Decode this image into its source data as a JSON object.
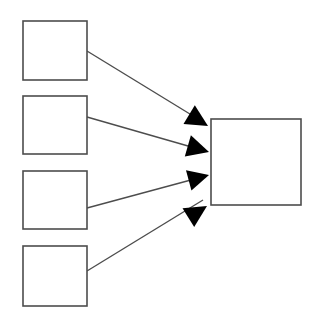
{
  "diagram": {
    "title": "",
    "type": "fan-in-flow",
    "canvas": {
      "width": 312,
      "height": 326,
      "background": "#ffffff"
    },
    "style": {
      "node_stroke_color": "#4d4d4d",
      "node_fill_color": "#ffffff",
      "node_stroke_width": 1.6,
      "edge_stroke_color": "#4d4d4d",
      "edge_stroke_width": 1.4,
      "arrow_fill_color": "#000000"
    },
    "nodes": [
      {
        "id": "source-1",
        "label": "",
        "x": 23,
        "y": 21,
        "width": 64,
        "height": 59
      },
      {
        "id": "source-2",
        "label": "",
        "x": 23,
        "y": 96,
        "width": 64,
        "height": 58
      },
      {
        "id": "source-3",
        "label": "",
        "x": 23,
        "y": 171,
        "width": 64,
        "height": 58
      },
      {
        "id": "source-4",
        "label": "",
        "x": 23,
        "y": 246,
        "width": 64,
        "height": 60
      },
      {
        "id": "target-1",
        "label": "",
        "x": 211,
        "y": 119,
        "width": 90,
        "height": 86
      }
    ],
    "edges": [
      {
        "id": "edge-1",
        "from": "source-1",
        "to": "target-1",
        "label": "",
        "x1": 87,
        "y1": 51,
        "x2": 203,
        "y2": 122,
        "arrow": {
          "tip_x": 208,
          "tip_y": 126,
          "angle": 31,
          "size": 22
        }
      },
      {
        "id": "edge-2",
        "from": "source-2",
        "to": "target-1",
        "label": "",
        "x1": 87,
        "y1": 117,
        "x2": 202,
        "y2": 150,
        "arrow": {
          "tip_x": 209,
          "tip_y": 152,
          "angle": 16,
          "size": 22
        }
      },
      {
        "id": "edge-3",
        "from": "source-3",
        "to": "target-1",
        "label": "",
        "x1": 87,
        "y1": 208,
        "x2": 202,
        "y2": 177,
        "arrow": {
          "tip_x": 209,
          "tip_y": 175,
          "angle": -15,
          "size": 21
        }
      },
      {
        "id": "edge-4",
        "from": "source-4",
        "to": "target-1",
        "label": "",
        "x1": 87,
        "y1": 271,
        "x2": 203,
        "y2": 200,
        "arrow": {
          "tip_x": 207,
          "tip_y": 206,
          "angle": -32,
          "size": 22
        }
      }
    ]
  }
}
